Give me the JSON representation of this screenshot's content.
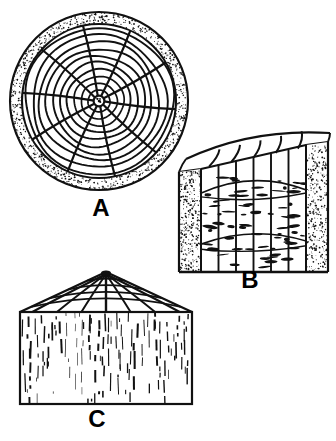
{
  "figure": {
    "background_color": "#ffffff",
    "ink_color": "#111111",
    "width": 336,
    "height": 441,
    "panels": [
      {
        "id": "A",
        "label": "A",
        "label_x": 101,
        "label_y": 216,
        "view": "transverse-end-grain-cross-section",
        "description": "Round log end cross-section with concentric annual growth rings, radial rays and stippled bark band",
        "center_x": 99,
        "center_y": 101,
        "outer_radius": 89,
        "bark_inner_radius": 77,
        "pith_radius": 5,
        "ring_radii": [
          11,
          18,
          25,
          32,
          39,
          46,
          53,
          60,
          67,
          74
        ],
        "ray_count": 10,
        "ray_angles_deg": [
          4,
          40,
          76,
          112,
          148,
          184,
          220,
          256,
          292,
          328
        ],
        "stipple_density": 560
      },
      {
        "id": "B",
        "label": "B",
        "label_x": 250,
        "label_y": 288,
        "view": "tangential-flat-sawn-surface",
        "description": "Flat-sawn board showing cathedral or loop figure, vertical ray lines, curved end-grain rings along the top and stippled bark on both side edges",
        "box_left": 179,
        "box_right": 328,
        "box_bottom": 272,
        "box_top_left_y": 172,
        "box_top_right_y": 142,
        "bark_band_width": 22,
        "vertical_line_count": 5,
        "cathedral_arc_count": 2,
        "top_ring_count": 5,
        "flake_count": 34,
        "stipple_density": 330
      },
      {
        "id": "C",
        "label": "C",
        "label_x": 97,
        "label_y": 427,
        "view": "radial-quarter-sawn-surface",
        "description": "Quarter-sawn board with straight vertical grain lines and a gabled end-grain top showing arcs radiating from the apex pith",
        "box_left": 20,
        "box_right": 192,
        "box_top": 312,
        "box_bottom": 404,
        "apex_x": 106,
        "apex_y": 272,
        "top_arc_count": 4,
        "top_ray_count": 7,
        "grain_line_count": 26
      }
    ]
  }
}
